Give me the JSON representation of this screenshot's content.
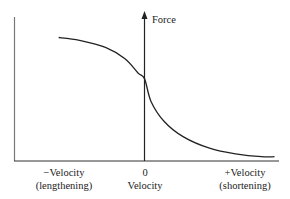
{
  "chart_data": {
    "type": "line",
    "title": "",
    "xlabel": "Velocity",
    "ylabel": "Force",
    "grid": false,
    "legend": null,
    "x_ticks": [
      {
        "value": -1,
        "line1": "−Velocity",
        "line2": "(lengthening)"
      },
      {
        "value": 0,
        "line1": "0",
        "line2": "Velocity"
      },
      {
        "value": 1,
        "line1": "+Velocity",
        "line2": "(shortening)"
      }
    ],
    "series": [
      {
        "name": "Force-velocity relationship",
        "x": [
          -0.66,
          -0.5,
          -0.3,
          -0.15,
          -0.05,
          0,
          0.05,
          0.15,
          0.3,
          0.5,
          0.7,
          0.9,
          1.0
        ],
        "y": [
          0.87,
          0.85,
          0.8,
          0.72,
          0.62,
          0.58,
          0.42,
          0.28,
          0.17,
          0.09,
          0.05,
          0.03,
          0.03
        ]
      }
    ],
    "xlim": [
      -1,
      1.02
    ],
    "ylim": [
      0,
      1
    ]
  },
  "labels": {
    "y_axis": "Force",
    "neg_velocity_1": "−Velocity",
    "neg_velocity_2": "(lengthening)",
    "zero_1": "0",
    "zero_2": "Velocity",
    "pos_velocity_1": "+Velocity",
    "pos_velocity_2": "(shortening)"
  },
  "colors": {
    "axis": "#333333",
    "left_axis": "#666666",
    "curve": "#222222"
  }
}
